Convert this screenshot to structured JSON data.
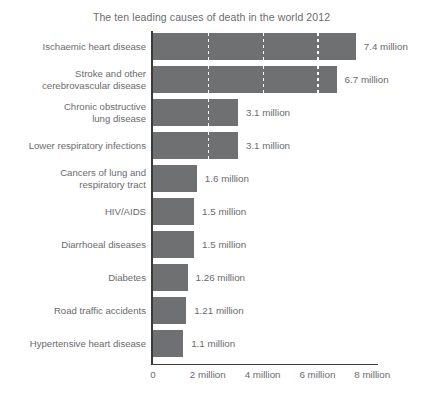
{
  "chart_data": {
    "type": "bar",
    "orientation": "horizontal",
    "title": "The ten leading causes of death in the world 2012",
    "xlabel": "",
    "ylabel": "",
    "xlim": [
      0,
      8.3
    ],
    "grid": true,
    "gridlines_at": [
      2,
      4,
      6
    ],
    "legend": null,
    "units": "million",
    "axis_tick_labels": [
      "0",
      "2 million",
      "4 million",
      "6 million",
      "8 million"
    ],
    "axis_tick_values": [
      0,
      2,
      4,
      6,
      8
    ],
    "categories": [
      "Ischaemic heart disease",
      "Stroke and other\ncerebrovascular disease",
      "Chronic obstructive\nlung disease",
      "Lower respiratory infections",
      "Cancers of lung and\nrespiratory tract",
      "HIV/AIDS",
      "Diarrhoeal diseases",
      "Diabetes",
      "Road traffic accidents",
      "Hypertensive heart disease"
    ],
    "values": [
      7.4,
      6.7,
      3.1,
      3.1,
      1.6,
      1.5,
      1.5,
      1.26,
      1.21,
      1.1
    ],
    "value_labels": [
      "7.4 million",
      "6.7 million",
      "3.1 million",
      "3.1 million",
      "1.6 million",
      "1.5 million",
      "1.5 million",
      "1.26 million",
      "1.21 million",
      "1.1 million"
    ],
    "colors": {
      "bar": "#6f7072",
      "axis": "#3b3b3b",
      "text": "#6a6b6d",
      "gridline": "#ffffff",
      "background": "#ffffff"
    }
  }
}
